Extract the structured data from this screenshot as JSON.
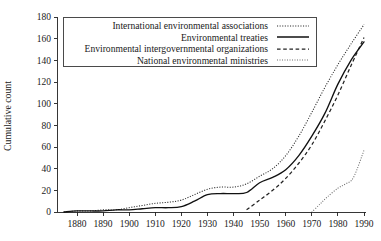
{
  "chart_data": {
    "type": "line",
    "title": "",
    "xlabel": "",
    "ylabel": "Cumulative count",
    "xlim": [
      1875,
      1990
    ],
    "ylim": [
      0,
      180
    ],
    "grid": false,
    "legend_position": "top-center",
    "x_ticks": [
      1880,
      1890,
      1900,
      1910,
      1920,
      1930,
      1940,
      1950,
      1960,
      1970,
      1980,
      1990
    ],
    "y_ticks": [
      0,
      20,
      40,
      60,
      80,
      100,
      120,
      140,
      160,
      180
    ],
    "series": [
      {
        "name": "International environmental associations",
        "style": "dotted",
        "x": [
          1875,
          1880,
          1885,
          1890,
          1895,
          1900,
          1905,
          1910,
          1915,
          1920,
          1925,
          1930,
          1935,
          1940,
          1945,
          1950,
          1955,
          1960,
          1965,
          1970,
          1975,
          1980,
          1985,
          1990
        ],
        "y": [
          0,
          1,
          1,
          2,
          2,
          4,
          6,
          8,
          9,
          11,
          16,
          21,
          23,
          23,
          26,
          33,
          40,
          52,
          70,
          92,
          115,
          136,
          155,
          173
        ]
      },
      {
        "name": "Environmental treaties",
        "style": "solid",
        "x": [
          1875,
          1880,
          1885,
          1890,
          1895,
          1900,
          1905,
          1910,
          1915,
          1920,
          1925,
          1930,
          1935,
          1940,
          1945,
          1950,
          1955,
          1960,
          1965,
          1970,
          1975,
          1980,
          1985,
          1990
        ],
        "y": [
          0,
          1,
          1,
          1,
          2,
          2,
          3,
          4,
          4,
          5,
          10,
          16,
          17,
          17,
          18,
          27,
          32,
          39,
          52,
          70,
          91,
          118,
          140,
          157
        ]
      },
      {
        "name": "Environmental intergovernmental organizations",
        "style": "dashed",
        "x": [
          1945,
          1950,
          1955,
          1960,
          1965,
          1970,
          1975,
          1980,
          1985,
          1990
        ],
        "y": [
          2,
          11,
          20,
          31,
          45,
          62,
          84,
          108,
          135,
          161
        ]
      },
      {
        "name": "National environmental ministries",
        "style": "dotted-sparse",
        "x": [
          1970,
          1973,
          1976,
          1980,
          1983,
          1986,
          1990
        ],
        "y": [
          0,
          7,
          14,
          22,
          26,
          32,
          57
        ]
      }
    ]
  },
  "legend": {
    "entries": [
      {
        "label": "International environmental associations",
        "sample": "dotted-line-sample"
      },
      {
        "label": "Environmental treaties",
        "sample": "solid-line-sample"
      },
      {
        "label": "Environmental intergovernmental organizations",
        "sample": "dashed-line-sample"
      },
      {
        "label": "National environmental ministries",
        "sample": "sparse-dotted-line-sample"
      }
    ]
  },
  "axes": {
    "y_title": "Cumulative count",
    "y_tick_labels": [
      "0",
      "20",
      "40",
      "60",
      "80",
      "100",
      "120",
      "140",
      "160",
      "180"
    ],
    "x_tick_labels": [
      "1880",
      "1890",
      "1900",
      "1910",
      "1920",
      "1930",
      "1940",
      "1950",
      "1960",
      "1970",
      "1980",
      "1990"
    ]
  },
  "colors": {
    "axis": "#202020",
    "associations": "#2b2b2b",
    "treaties": "#111111",
    "igos": "#222222",
    "ministries": "#6d6d6d",
    "legend_border": "#4a4a4a",
    "background": "#ffffff"
  }
}
